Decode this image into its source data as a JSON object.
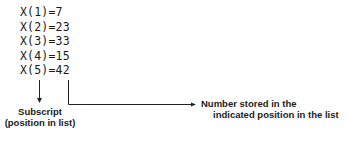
{
  "list_entries": [
    {
      "text": "X(1)=7",
      "subscript": 1,
      "value": 7
    },
    {
      "text": "X(2)=23",
      "subscript": 2,
      "value": 23
    },
    {
      "text": "X(3)=33",
      "subscript": 3,
      "value": 33
    },
    {
      "text": "X(4)=15",
      "subscript": 4,
      "value": 15
    },
    {
      "text": "X(5)=42",
      "subscript": 5,
      "value": 42
    }
  ],
  "annotations": {
    "subscript_line1": "Subscript",
    "subscript_line2": "(position in list)",
    "value_line1": "Number stored in the",
    "value_line2": "indicated position in the list"
  }
}
